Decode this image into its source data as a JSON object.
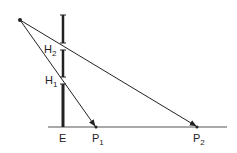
{
  "diagram": {
    "labels": {
      "h2": "H",
      "h2_sub": "2",
      "h1": "H",
      "h1_sub": "1",
      "e": "E",
      "p1": "P",
      "p1_sub": "1",
      "p2": "P",
      "p2_sub": "2"
    },
    "colors": {
      "stroke": "#222222",
      "background": "#ffffff",
      "baseline": "#555555"
    }
  }
}
